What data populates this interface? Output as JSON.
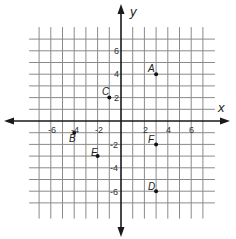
{
  "graph": {
    "x_axis_label": "x",
    "y_axis_label": "y",
    "x_ticks": [
      {
        "value": -6,
        "label": "-6"
      },
      {
        "value": -4,
        "label": "-4"
      },
      {
        "value": -2,
        "label": "-2"
      },
      {
        "value": 2,
        "label": "2"
      },
      {
        "value": 4,
        "label": "4"
      },
      {
        "value": 6,
        "label": "6"
      }
    ],
    "y_ticks": [
      {
        "value": 6,
        "label": "6"
      },
      {
        "value": 4,
        "label": "4"
      },
      {
        "value": 2,
        "label": "2"
      },
      {
        "value": -2,
        "label": "-2"
      },
      {
        "value": -4,
        "label": "-4"
      },
      {
        "value": -6,
        "label": "-6"
      }
    ],
    "grid_range": {
      "x": [
        -7,
        7
      ],
      "y": [
        -8,
        7
      ]
    },
    "points": [
      {
        "name": "A",
        "x": 3,
        "y": 4
      },
      {
        "name": "B",
        "x": -4,
        "y": -1
      },
      {
        "name": "C",
        "x": -1,
        "y": 2
      },
      {
        "name": "D",
        "x": 3,
        "y": -6
      },
      {
        "name": "E",
        "x": -2,
        "y": -3
      },
      {
        "name": "F",
        "x": 3,
        "y": -2
      }
    ],
    "colors": {
      "grid": "#8a8a8a",
      "axis": "#1a1a1a",
      "point": "#111111"
    }
  }
}
